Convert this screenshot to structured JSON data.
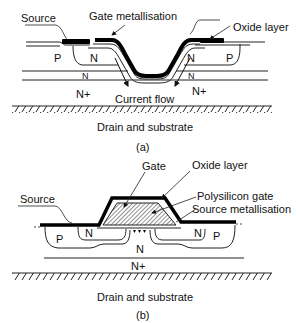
{
  "diagram_a": {
    "labels": {
      "source": "Source",
      "gate_metallisation": "Gate metallisation",
      "oxide_layer": "Oxide layer",
      "current_flow": "Current flow",
      "drain_substrate": "Drain and substrate"
    },
    "regions": {
      "p_left": "P",
      "n_left": "N",
      "n_right": "N",
      "p_right": "P",
      "n_mid_left": "N",
      "n_mid_right": "N",
      "nplus_left": "N+",
      "nplus_right": "N+"
    },
    "caption": "(a)"
  },
  "diagram_b": {
    "labels": {
      "gate": "Gate",
      "oxide_layer": "Oxide layer",
      "source": "Source",
      "polysilicon_gate": "Polysilicon gate",
      "source_metallisation": "Source metallisation",
      "drain_substrate": "Drain and substrate"
    },
    "regions": {
      "p_left": "P",
      "n_left": "N",
      "n_right": "N",
      "p_right": "P",
      "n_center": "N",
      "nplus": "N+"
    },
    "caption": "(b)"
  }
}
